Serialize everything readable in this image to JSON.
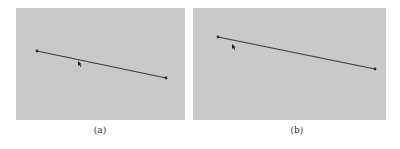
{
  "panels": [
    {
      "caption": "(a)",
      "line": {
        "x1": 37,
        "y1": 51,
        "x2": 166,
        "y2": 78
      },
      "cursor": {
        "x": 78,
        "y": 61
      }
    },
    {
      "caption": "(b)",
      "line": {
        "x1": 218,
        "y1": 37,
        "x2": 375,
        "y2": 69
      },
      "cursor": {
        "x": 232,
        "y": 44
      }
    }
  ],
  "colors": {
    "background": "#c9c9c9",
    "line": "#3a3a48"
  }
}
